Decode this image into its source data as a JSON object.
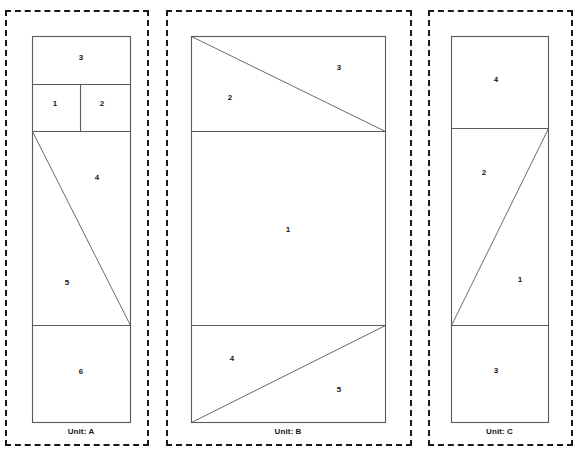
{
  "figure": {
    "width": 580,
    "height": 458,
    "background_color": "#ffffff",
    "line_color": "#555b60",
    "dashed_border_color": "#1a1a1a",
    "label_color": "#161616"
  },
  "panels": [
    {
      "id": "panel-a",
      "unit_label": "Unit: A",
      "dashed_frame": {
        "x": 5,
        "y": 10,
        "width": 144,
        "height": 436
      },
      "plan_box": {
        "x": 32,
        "y": 36,
        "width": 98,
        "height": 386
      },
      "horizontal_lines": [
        84,
        131,
        325
      ],
      "vertical_lines": [
        {
          "x": 80,
          "y1": 84,
          "y2": 131
        }
      ],
      "diagonals": [
        {
          "x1": 32,
          "y1": 131,
          "x2": 130,
          "y2": 325
        }
      ],
      "regions": [
        {
          "label": "3",
          "x": 81,
          "y": 58
        },
        {
          "label": "1",
          "x": 55,
          "y": 104
        },
        {
          "label": "2",
          "x": 102,
          "y": 104
        },
        {
          "label": "4",
          "x": 97,
          "y": 178
        },
        {
          "label": "5",
          "x": 67,
          "y": 283
        },
        {
          "label": "6",
          "x": 81,
          "y": 372
        }
      ],
      "label_position": {
        "x": 32,
        "y": 427,
        "width": 98
      }
    },
    {
      "id": "panel-b",
      "unit_label": "Unit: B",
      "dashed_frame": {
        "x": 166,
        "y": 10,
        "width": 246,
        "height": 436
      },
      "plan_box": {
        "x": 191,
        "y": 36,
        "width": 194,
        "height": 386
      },
      "horizontal_lines": [
        131,
        325
      ],
      "vertical_lines": [],
      "diagonals": [
        {
          "x1": 191,
          "y1": 36,
          "x2": 385,
          "y2": 131
        },
        {
          "x1": 191,
          "y1": 422,
          "x2": 385,
          "y2": 325
        }
      ],
      "regions": [
        {
          "label": "2",
          "x": 230,
          "y": 98
        },
        {
          "label": "3",
          "x": 339,
          "y": 68
        },
        {
          "label": "1",
          "x": 288,
          "y": 230
        },
        {
          "label": "4",
          "x": 232,
          "y": 359
        },
        {
          "label": "5",
          "x": 339,
          "y": 390
        }
      ],
      "label_position": {
        "x": 191,
        "y": 427,
        "width": 194
      }
    },
    {
      "id": "panel-c",
      "unit_label": "Unit: C",
      "dashed_frame": {
        "x": 428,
        "y": 10,
        "width": 145,
        "height": 436
      },
      "plan_box": {
        "x": 451,
        "y": 36,
        "width": 97,
        "height": 386
      },
      "horizontal_lines": [
        128,
        325
      ],
      "vertical_lines": [],
      "diagonals": [
        {
          "x1": 451,
          "y1": 325,
          "x2": 548,
          "y2": 128
        }
      ],
      "regions": [
        {
          "label": "4",
          "x": 496,
          "y": 80
        },
        {
          "label": "2",
          "x": 484,
          "y": 173
        },
        {
          "label": "1",
          "x": 520,
          "y": 280
        },
        {
          "label": "3",
          "x": 496,
          "y": 371
        }
      ],
      "label_position": {
        "x": 451,
        "y": 427,
        "width": 97
      }
    }
  ]
}
